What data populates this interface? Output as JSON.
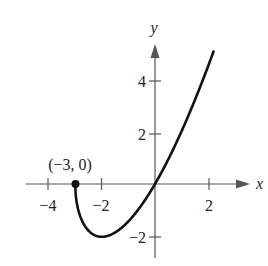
{
  "chart_data": {
    "type": "line",
    "title": "",
    "xlabel": "x",
    "ylabel": "y",
    "xlim": [
      -4.5,
      3.2
    ],
    "ylim": [
      -2.8,
      5.4
    ],
    "x_ticks": [
      -4,
      -2,
      2
    ],
    "x_tick_labels": [
      "−4",
      "−2",
      "2"
    ],
    "y_ticks": [
      -2,
      2,
      4
    ],
    "y_tick_labels": [
      "−2",
      "2",
      "4"
    ],
    "grid": false,
    "legend": null,
    "series": [
      {
        "name": "f(x)",
        "function": "x*sqrt(x+3)",
        "x": [
          -3,
          -2.9,
          -2.75,
          -2.5,
          -2.25,
          -2,
          -1.75,
          -1.5,
          -1,
          -0.5,
          0,
          0.5,
          1,
          1.5,
          2,
          2.2
        ],
        "y": [
          0,
          -0.92,
          -1.38,
          -1.77,
          -1.95,
          -2.0,
          -1.96,
          -1.84,
          -1.41,
          -0.79,
          0,
          0.94,
          2.0,
          3.18,
          4.47,
          5.02
        ]
      }
    ],
    "annotations": [
      {
        "text": "(−3, 0)",
        "x": -3,
        "y": 0,
        "marker": "filled-dot"
      }
    ]
  },
  "labels": {
    "point": "(−3, 0)",
    "x_axis": "x",
    "y_axis": "y"
  }
}
